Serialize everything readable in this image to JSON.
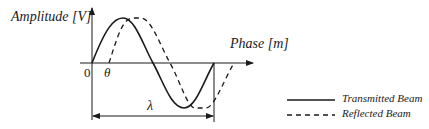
{
  "diagram": {
    "y_axis_label": "Amplitude [V]",
    "x_axis_label": "Phase [m]",
    "origin_label": "0",
    "phase_offset_label": "θ",
    "wavelength_label": "λ",
    "legend": [
      {
        "label": "Transmitted Beam",
        "style": "solid"
      },
      {
        "label": "Reflected Beam",
        "style": "dashed"
      }
    ],
    "colors": {
      "line": "#1a1a1a",
      "background": "#ffffff"
    }
  }
}
